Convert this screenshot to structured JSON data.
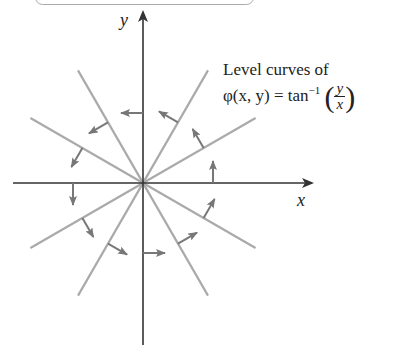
{
  "caption": {
    "line1": "Level curves of",
    "func": "φ(x, y) = tan",
    "exponent": "−1",
    "frac_num": "y",
    "frac_den": "x",
    "open_paren": "(",
    "close_paren": ")"
  },
  "axes": {
    "x_label": "x",
    "y_label": "y"
  },
  "colors": {
    "axis": "#333333",
    "level_curve": "#aaaaaa",
    "gradient_arrow": "#777777"
  },
  "level_curve_angles_deg": [
    30,
    60,
    120,
    150
  ],
  "gradient_arrow_angles_deg": [
    0,
    30,
    60,
    90,
    120,
    150,
    180,
    210,
    240,
    270,
    300,
    330
  ]
}
